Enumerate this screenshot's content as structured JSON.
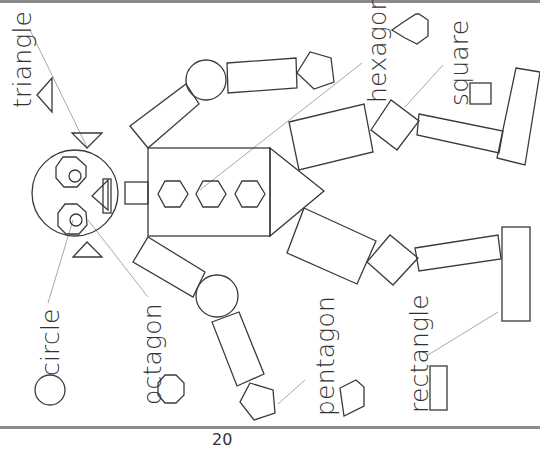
{
  "page": {
    "type": "worksheet",
    "background": "#ffffff",
    "rule_color": "#8a8a8a",
    "stroke_color": "#3a3a3a",
    "page_number": "20"
  },
  "labels": {
    "triangle": "triangle",
    "circle": "circle",
    "octagon": "octagon",
    "pentagon": "pentagon",
    "hexagon": "hexagon",
    "square": "square",
    "rectangle": "rectangle"
  },
  "legend_icons": [
    {
      "shape": "triangle",
      "icon": "triangle-icon"
    },
    {
      "shape": "circle",
      "icon": "circle-icon"
    },
    {
      "shape": "octagon",
      "icon": "octagon-icon"
    },
    {
      "shape": "pentagon",
      "icon": "pentagon-icon"
    },
    {
      "shape": "hexagon",
      "icon": "hexagon-icon"
    },
    {
      "shape": "square",
      "icon": "square-icon"
    },
    {
      "shape": "rectangle",
      "icon": "rectangle-icon"
    }
  ],
  "robot": {
    "head": "circle",
    "eyes": [
      "octagon",
      "octagon"
    ],
    "pupils": [
      "circle",
      "circle"
    ],
    "nose": "triangle",
    "mouth": "rectangle",
    "ears": [
      "triangle",
      "triangle"
    ],
    "neck": "rectangle",
    "body": "rectangle",
    "body_buttons": [
      "hexagon",
      "hexagon",
      "hexagon"
    ],
    "body_point": "triangle",
    "arms": [
      {
        "upper": "rectangle",
        "joint": "circle",
        "lower": "rectangle",
        "hand": "pentagon"
      },
      {
        "upper": "rectangle",
        "joint": "circle",
        "lower": "rectangle",
        "hand": "pentagon"
      }
    ],
    "legs": [
      {
        "upper": "rectangle",
        "knee": "square",
        "lower": "rectangle",
        "foot": "rectangle"
      },
      {
        "upper": "rectangle",
        "knee": "square",
        "lower": "rectangle",
        "foot": "rectangle"
      }
    ]
  }
}
